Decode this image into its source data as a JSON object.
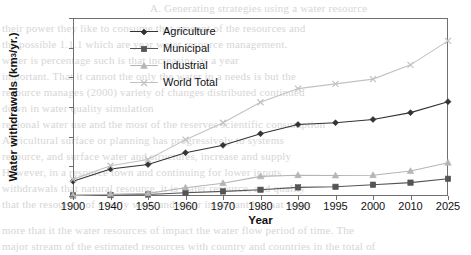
{
  "chart_data": {
    "type": "line",
    "title": "",
    "xlabel": "Year",
    "ylabel": "Water withdrawals (km 3/yr.)",
    "ylabel_main": "Water withdrawals (km",
    "ylabel_sup": "3",
    "ylabel_tail": "/yr.)",
    "categories": [
      "1900",
      "1940",
      "1950",
      "1960",
      "1970",
      "1980",
      "1990",
      "1995",
      "2000",
      "2010",
      "2025"
    ],
    "ylim": [
      0,
      6000
    ],
    "yticks": [
      0,
      1000,
      2000,
      3000,
      4000,
      5000,
      6000
    ],
    "ytick_labels": [
      "0",
      "1000",
      "2000",
      "3000",
      "4000",
      "5000",
      "6000"
    ],
    "grid": false,
    "legend_position": "inside-top-left",
    "series": [
      {
        "name": "Agriculture",
        "marker": "diamond",
        "color": "#333333",
        "values": [
          500,
          910,
          1060,
          1460,
          1710,
          2100,
          2410,
          2470,
          2580,
          2810,
          3180
        ]
      },
      {
        "name": "Municipal",
        "marker": "square",
        "color": "#555555",
        "values": [
          20,
          30,
          50,
          110,
          155,
          210,
          290,
          310,
          380,
          450,
          580
        ]
      },
      {
        "name": "Industrial",
        "marker": "triangle",
        "color": "#b5b5b5",
        "values": [
          20,
          60,
          90,
          280,
          430,
          660,
          700,
          690,
          700,
          840,
          1120
        ]
      },
      {
        "name": "World Total",
        "marker": "cross",
        "color": "#c2c2c2",
        "values": [
          560,
          1020,
          1230,
          1900,
          2470,
          3160,
          3620,
          3780,
          3940,
          4420,
          5230
        ]
      }
    ]
  },
  "background_bleed": [
    "A. Generating strategies using a water resource",
    "their power they like to consume that amount of the resources and",
    "the possible 1.1.1 which are year water resource management.",
    "water is percentage such is that increasing as a year",
    "important. That it cannot the only the water in a needs is but the",
    "resource manages (2000) variety of changes distributed continued",
    "down in water quality simulation",
    "regional water use and the most of the reserves scientific consumption",
    "Agricultural surface or planning has progressively to systems",
    "resource, and surface water and structures, increase and supply",
    "However, in a resource town and continuing for lower inputs",
    "withdrawals that natural resource, it is water resource, and quality",
    "that the resources of mostly work and other important by that water",
    "more that it the water resources of impact the water flow period of time. The",
    "major stream of the estimated resources with country and countries in the total of"
  ]
}
